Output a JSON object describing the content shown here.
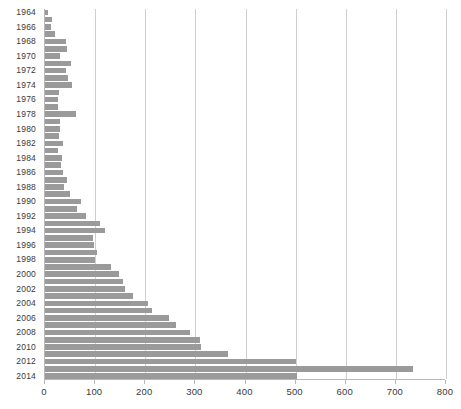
{
  "chart_data": {
    "type": "bar",
    "orientation": "horizontal",
    "title": "",
    "subtitle": "",
    "xlabel": "",
    "ylabel": "",
    "xlim": [
      0,
      800
    ],
    "ylim": null,
    "grid": true,
    "grid_axis": "x",
    "legend": null,
    "legend_position": "none",
    "annotations": [],
    "xticks": [
      0,
      100,
      200,
      300,
      400,
      500,
      600,
      700,
      800
    ],
    "xticklabels": [
      "0",
      "100",
      "200",
      "300",
      "400",
      "500",
      "600",
      "700",
      "800"
    ],
    "yticklabels": [
      "1964",
      "1966",
      "1968",
      "1970",
      "1972",
      "1974",
      "1976",
      "1978",
      "1980",
      "1982",
      "1984",
      "1986",
      "1988",
      "1990",
      "1992",
      "1994",
      "1996",
      "1998",
      "2000",
      "2002",
      "2004",
      "2006",
      "2008",
      "2010",
      "2012",
      "2014"
    ],
    "ytick_step_years": 2,
    "categories": [
      "1964",
      "1965",
      "1966",
      "1967",
      "1968",
      "1969",
      "1970",
      "1971",
      "1972",
      "1973",
      "1974",
      "1975",
      "1976",
      "1977",
      "1978",
      "1979",
      "1980",
      "1981",
      "1982",
      "1983",
      "1984",
      "1985",
      "1986",
      "1987",
      "1988",
      "1989",
      "1990",
      "1991",
      "1992",
      "1993",
      "1994",
      "1995",
      "1996",
      "1997",
      "1998",
      "1999",
      "2000",
      "2001",
      "2002",
      "2003",
      "2004",
      "2005",
      "2006",
      "2007",
      "2008",
      "2009",
      "2010",
      "2011",
      "2012",
      "2013",
      "2014"
    ],
    "values": [
      6,
      14,
      12,
      20,
      41,
      44,
      30,
      52,
      42,
      45,
      53,
      28,
      25,
      26,
      62,
      30,
      30,
      27,
      36,
      25,
      34,
      32,
      36,
      43,
      38,
      50,
      72,
      64,
      81,
      110,
      120,
      95,
      98,
      103,
      99,
      131,
      147,
      155,
      159,
      175,
      205,
      213,
      248,
      262,
      290,
      310,
      312,
      365,
      500,
      735,
      503
    ],
    "bar_color": "#9a9a9a",
    "grid_color": "#cfcfcf",
    "axis_color": "#b8b8b8",
    "background_color": "#ffffff"
  }
}
